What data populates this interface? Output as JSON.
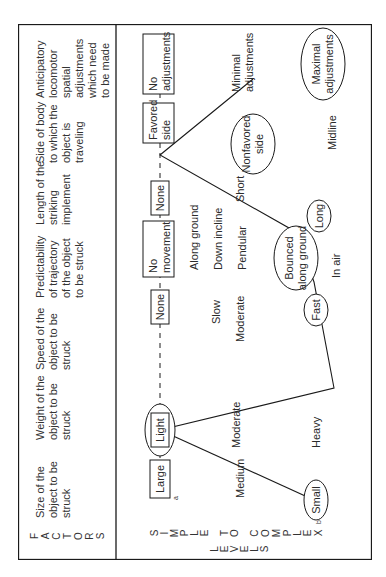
{
  "figure": {
    "factors_label": [
      "F",
      "A",
      "C",
      "T",
      "O",
      "R",
      "S"
    ],
    "levels_axis": {
      "simple_to_complex": [
        "S",
        "I",
        "M",
        "P",
        "L",
        "E",
        " ",
        "T",
        "O",
        " ",
        "C",
        "O",
        "M",
        "P",
        "L",
        "E",
        "X"
      ],
      "levels": [
        "L",
        "E",
        "V",
        "E",
        "L",
        "S"
      ]
    },
    "factors": [
      {
        "header": [
          "Size of the",
          "object to be",
          "struck"
        ],
        "simple": "Large",
        "simple_note": "a",
        "middle": [
          "Medium"
        ],
        "complex": "Small",
        "complex_note": "b"
      },
      {
        "header": [
          "Weight of the",
          "object to be",
          "struck"
        ],
        "simple": "Light",
        "middle": [
          "Moderate"
        ],
        "complex": "Heavy"
      },
      {
        "header": [
          "Speed of the",
          "object to be",
          "struck"
        ],
        "simple": "None",
        "middle": [
          "Slow",
          "Moderate"
        ],
        "complex": "Fast"
      },
      {
        "header": [
          "Predictability",
          "of trajectory",
          "of the object",
          "to be struck"
        ],
        "simple": [
          "No",
          "movement"
        ],
        "middle": [
          "Along ground",
          "Down incline",
          "Pendular"
        ],
        "complex": [
          "Bounced",
          "along ground"
        ],
        "complex_alt": "In air"
      },
      {
        "header": [
          "Length of the",
          "striking",
          "implement"
        ],
        "simple": "None",
        "middle": [
          "Short"
        ],
        "complex": "Long"
      },
      {
        "header": [
          "Side of body",
          "to which the",
          "object is",
          "traveling"
        ],
        "simple": [
          "Favored",
          "side"
        ],
        "middle": [],
        "complex": [
          "Nonfavored",
          "side"
        ],
        "complex_alt": "Midline"
      },
      {
        "header": [
          "Anticipatory",
          "locomotor",
          "spatial",
          "adjustments",
          "which need",
          "to be made"
        ],
        "simple": [
          "No",
          "adjustments"
        ],
        "middle": [
          "Minimal",
          "adjustments"
        ],
        "complex": [
          "Maximal",
          "adjustments"
        ]
      }
    ],
    "colors": {
      "line": "#1a1a1a",
      "text": "#2a2a2a",
      "background": "#ffffff"
    }
  }
}
